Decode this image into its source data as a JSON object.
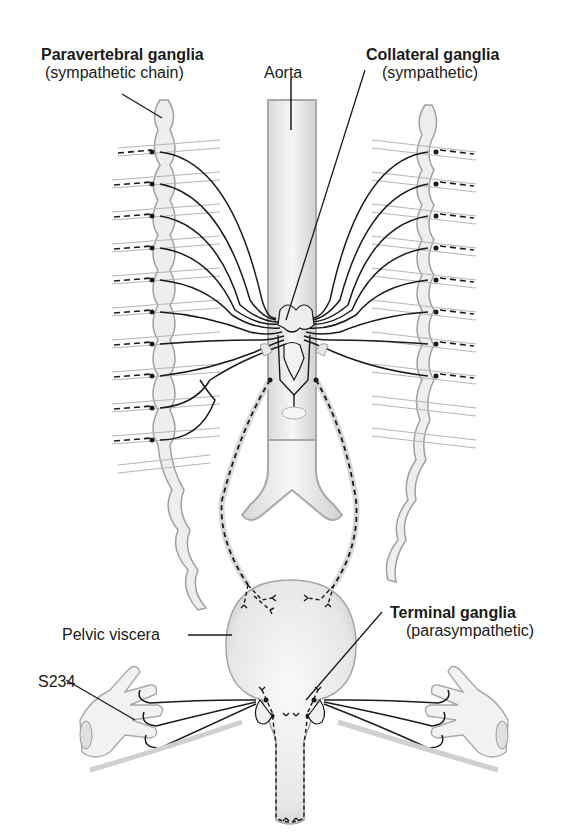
{
  "figure": {
    "background": "#ffffff",
    "line_color": "#1a1a1a",
    "structure_color": "#9a9a9a",
    "fill_color": "#efefef"
  },
  "labels": {
    "paravertebral": {
      "title": "Paravertebral ganglia",
      "subtitle": "(sympathetic chain)"
    },
    "aorta": {
      "title": "Aorta"
    },
    "collateral": {
      "title": "Collateral ganglia",
      "subtitle": "(sympathetic)"
    },
    "pelvic_viscera": {
      "title": "Pelvic viscera"
    },
    "terminal": {
      "title": "Terminal ganglia",
      "subtitle": "(parasympathetic)"
    },
    "sacral": {
      "title": "S234"
    }
  },
  "legend_hints": {
    "solid_line": "preganglionic/postganglionic sympathetic fibers",
    "dashed_line": "parasympathetic / visceral fibers"
  }
}
